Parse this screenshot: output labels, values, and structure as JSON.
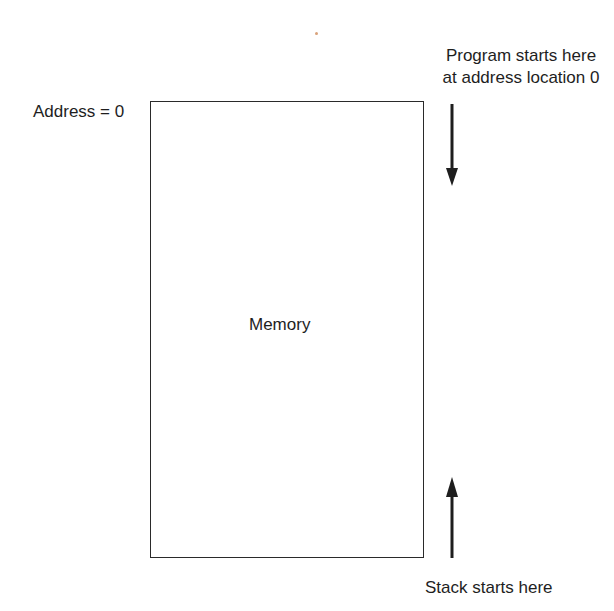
{
  "diagram": {
    "memory_label": "Memory",
    "address_label": "Address = 0",
    "program_label": {
      "line1": "Program starts here",
      "line2": "at address location 0"
    },
    "stack_label": "Stack starts here",
    "arrows": [
      {
        "name": "program-growth",
        "direction": "down"
      },
      {
        "name": "stack-growth",
        "direction": "up"
      }
    ]
  }
}
